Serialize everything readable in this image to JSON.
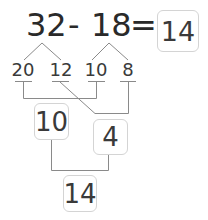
{
  "equation": {
    "minuend": "32",
    "operator": "-",
    "subtrahend": "18",
    "equals": "=",
    "answer": "14"
  },
  "decomposition": {
    "minuend_parts": [
      "20",
      "12"
    ],
    "subtrahend_parts": [
      "10",
      "8"
    ]
  },
  "intermediate": {
    "tens_difference": "10",
    "ones_difference": "4"
  },
  "final": {
    "result": "14"
  },
  "colors": {
    "text": "#333333",
    "lines": "#888888",
    "box_border": "#d4d4d4"
  }
}
